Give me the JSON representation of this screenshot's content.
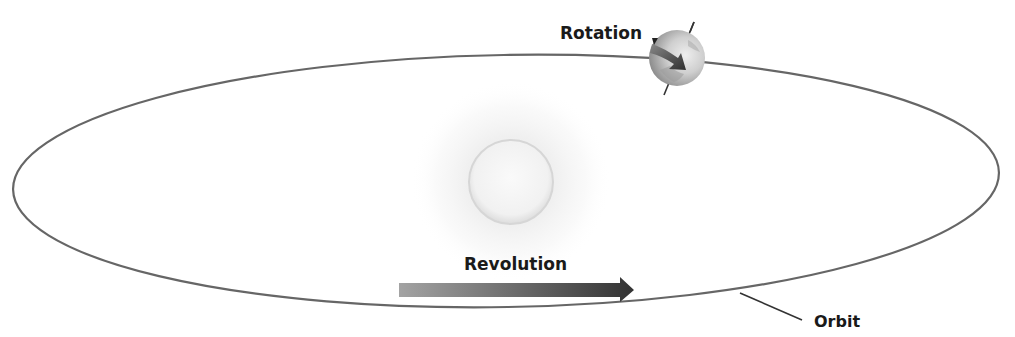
{
  "diagram": {
    "labels": {
      "rotation": "Rotation",
      "revolution": "Revolution",
      "orbit": "Orbit"
    },
    "elements": {
      "orbit": {
        "shape": "ellipse",
        "stroke": "#666666"
      },
      "sun": {
        "shape": "glowing-circle",
        "color": "#d8d8d8"
      },
      "earth": {
        "shape": "globe-with-tilted-axis",
        "color": "#b5b5b5"
      },
      "rotation_arrow": {
        "shape": "curved-arrow",
        "color": "#555555"
      },
      "revolution_arrow": {
        "shape": "gradient-arrow",
        "color_start": "#a0a0a0",
        "color_end": "#333333"
      }
    }
  }
}
